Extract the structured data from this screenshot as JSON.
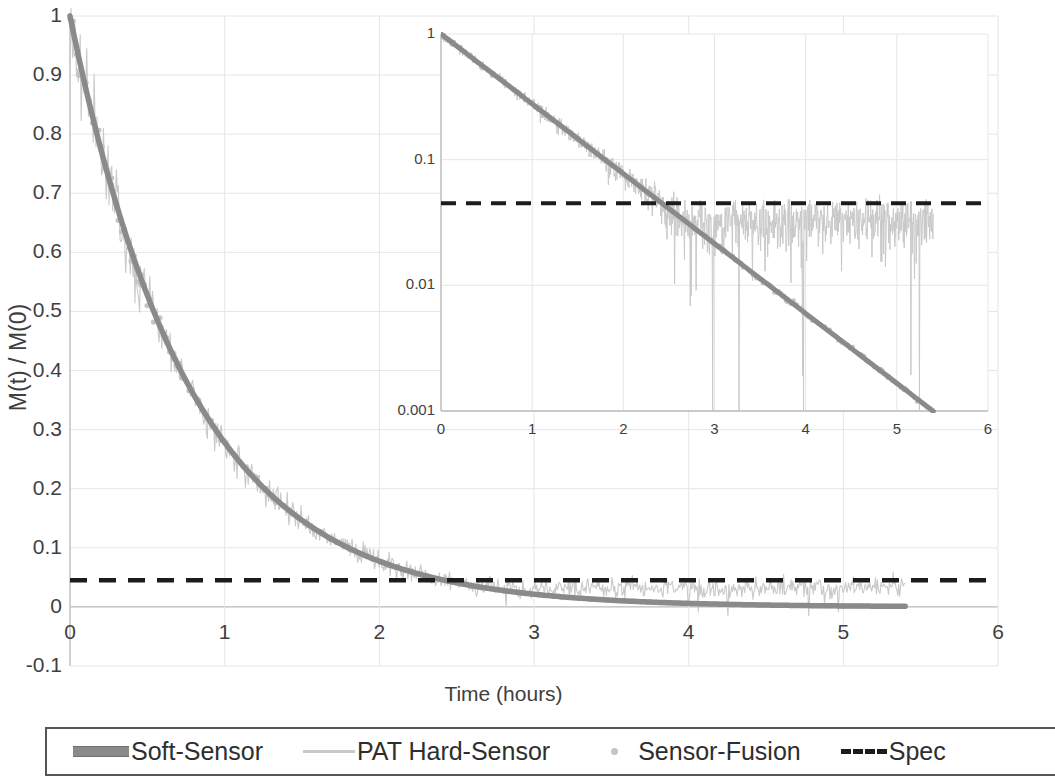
{
  "chart_data": {
    "type": "line",
    "title": "",
    "xlabel": "Time (hours)",
    "ylabel": "M(t) / M(0)",
    "xlim": [
      0,
      6
    ],
    "ylim": [
      -0.1,
      1
    ],
    "grid": true,
    "legend_position": "bottom",
    "xticks": [
      "0",
      "1",
      "2",
      "3",
      "4",
      "5",
      "6"
    ],
    "xtick_values": [
      0,
      1,
      2,
      3,
      4,
      5,
      6
    ],
    "yticks": [
      "-0.1",
      "0",
      "0.1",
      "0.2",
      "0.3",
      "0.4",
      "0.5",
      "0.6",
      "0.7",
      "0.8",
      "0.9",
      "1"
    ],
    "ytick_values": [
      -0.1,
      0,
      0.1,
      0.2,
      0.3,
      0.4,
      0.5,
      0.6,
      0.7,
      0.8,
      0.9,
      1
    ],
    "spec_value": 0.045,
    "t_end": 5.4,
    "series": [
      {
        "name": "Soft-Sensor",
        "style": "thick-line",
        "color": "#8a8a8a",
        "model": "M(t)/M(0) = exp(-k*t), k = 1.28 1/h",
        "x": [
          0,
          0.25,
          0.5,
          0.75,
          1,
          1.25,
          1.5,
          1.75,
          2,
          2.25,
          2.5,
          2.75,
          3,
          3.25,
          3.5,
          3.75,
          4,
          4.25,
          4.5,
          4.75,
          5,
          5.25,
          5.4
        ],
        "values": [
          1.0,
          0.726,
          0.527,
          0.383,
          0.278,
          0.202,
          0.147,
          0.106,
          0.077,
          0.056,
          0.041,
          0.03,
          0.0215,
          0.0156,
          0.0114,
          0.0082,
          0.006,
          0.0043,
          0.0031,
          0.0023,
          0.0017,
          0.0012,
          0.00099
        ]
      },
      {
        "name": "PAT Hard-Sensor",
        "style": "thin-noisy-line",
        "color": "#c9c9c9",
        "note": "noisy measurement; noise floor grows so trace flattens near spec after t ~ 3 h",
        "x": [
          0,
          0.25,
          0.5,
          0.75,
          1,
          1.25,
          1.5,
          1.75,
          2,
          2.25,
          2.5,
          2.75,
          3,
          3.25,
          3.5,
          3.75,
          4,
          4.25,
          4.5,
          4.75,
          5,
          5.25,
          5.4
        ],
        "values": [
          1.0,
          0.73,
          0.53,
          0.39,
          0.29,
          0.21,
          0.16,
          0.12,
          0.095,
          0.075,
          0.06,
          0.05,
          0.045,
          0.042,
          0.04,
          0.038,
          0.037,
          0.036,
          0.035,
          0.034,
          0.033,
          0.032,
          0.031
        ]
      },
      {
        "name": "Sensor-Fusion",
        "style": "dot-marker",
        "color": "#c4c4c4",
        "x": [
          0,
          0.25,
          0.5,
          0.75,
          1,
          1.25,
          1.5,
          1.75,
          2,
          2.25,
          2.5,
          2.75,
          3,
          3.25,
          3.5,
          3.75,
          4,
          4.25,
          4.5,
          4.75,
          5,
          5.25,
          5.4
        ],
        "values": [
          1.0,
          0.727,
          0.528,
          0.384,
          0.279,
          0.203,
          0.147,
          0.107,
          0.078,
          0.056,
          0.041,
          0.03,
          0.0216,
          0.0157,
          0.0114,
          0.0083,
          0.006,
          0.0044,
          0.0032,
          0.0023,
          0.0017,
          0.0012,
          0.001
        ]
      },
      {
        "name": "Spec",
        "style": "dashed-line",
        "color": "#1c1c1c",
        "constant": 0.045
      }
    ]
  },
  "inset_chart": {
    "type": "line",
    "yscale": "log",
    "xlabel": "",
    "ylabel": "",
    "xlim": [
      0,
      6
    ],
    "ylim": [
      0.001,
      1
    ],
    "grid": true,
    "xticks": [
      "0",
      "1",
      "2",
      "3",
      "4",
      "5",
      "6"
    ],
    "xtick_values": [
      0,
      1,
      2,
      3,
      4,
      5,
      6
    ],
    "yticks": [
      "1",
      "0.1",
      "0.01",
      "0.001"
    ],
    "ytick_values": [
      1,
      0.1,
      0.01,
      0.001
    ],
    "spec_value": 0.045,
    "t_end": 5.4,
    "series": [
      {
        "name": "Soft-Sensor",
        "color": "#8a8a8a",
        "style": "thick-line"
      },
      {
        "name": "PAT Hard-Sensor",
        "color": "#c9c9c9",
        "style": "thin-noisy-line"
      },
      {
        "name": "Sensor-Fusion",
        "color": "#c4c4c4",
        "style": "dot-marker"
      },
      {
        "name": "Spec",
        "color": "#1c1c1c",
        "style": "dashed-line",
        "constant": 0.045
      }
    ]
  },
  "legend": {
    "items": [
      {
        "label": "Soft-Sensor",
        "key": "thick-line-key",
        "color": "#8a8a8a"
      },
      {
        "label": "PAT Hard-Sensor",
        "key": "thin-line-key",
        "color": "#c9c9c9"
      },
      {
        "label": "Sensor-Fusion",
        "key": "dot-marker-key",
        "color": "#c4c4c4"
      },
      {
        "label": "Spec",
        "key": "dashed-line-key",
        "color": "#1c1c1c"
      }
    ]
  },
  "colors": {
    "soft_sensor": "#8a8a8a",
    "pat_hard_sensor": "#c9c9c9",
    "sensor_fusion": "#c4c4c4",
    "spec": "#1c1c1c",
    "grid": "#e3e3e3",
    "text": "#3f3f3f"
  }
}
